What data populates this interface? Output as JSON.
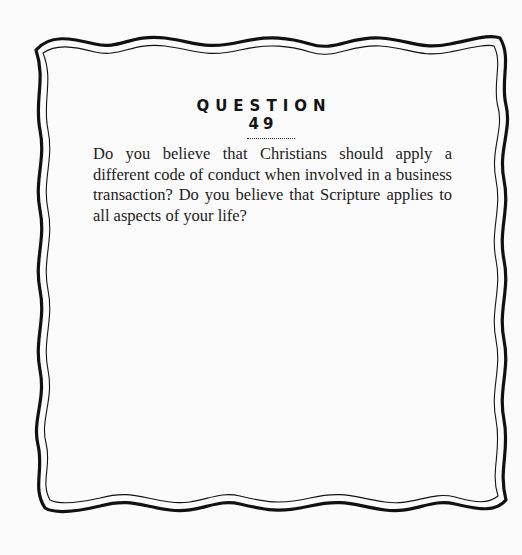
{
  "card": {
    "heading_word": "QUESTION",
    "question_number": "49",
    "body": "Do you believe that Christians should apply a different code of conduct when involved in a business transaction? Do you believe that Scripture applies to all aspects of your life?",
    "colors": {
      "background": "#fbfbfb",
      "border": "#111111",
      "text": "#1c1c1c"
    }
  }
}
